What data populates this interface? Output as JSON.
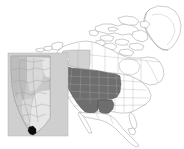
{
  "figure": {
    "kind": "distribution-range-map",
    "title": "North America distribution map with Alberta inset",
    "width": 184,
    "height": 149,
    "background_color": "#ffffff",
    "has_text_labels": false,
    "has_legend": false,
    "has_scale_bar": false,
    "has_north_arrow": false,
    "has_graticule": false
  },
  "colors": {
    "land_fill": "#ffffff",
    "land_outline": "#8f8f8f",
    "internal_border": "#a8a8a8",
    "range_primary": "#6e6e6e",
    "range_secondary": "#d2d2d2",
    "inset_panel_background": "#cfcfcf",
    "inset_land": "#c9c9c9",
    "locality_marker": "#0d0d0d"
  },
  "main_map": {
    "name": "north-america-basemap",
    "extent_description": "North America including Greenland, Canada, United States, Mexico and Central America",
    "countries_shown": [
      "Canada",
      "United States",
      "Mexico",
      "Greenland"
    ],
    "shaded_regions": [
      {
        "name": "primary-range",
        "color": "#6e6e6e",
        "tone": "dark gray",
        "description": "Western and Great Plains United States",
        "units": [
          "California",
          "Nevada",
          "Oregon",
          "Idaho",
          "Washington",
          "Montana",
          "Wyoming",
          "Utah",
          "Colorado",
          "Arizona",
          "New Mexico",
          "North Dakota",
          "South Dakota",
          "Nebraska",
          "Kansas",
          "Oklahoma",
          "Texas"
        ],
        "unit_count": 17
      },
      {
        "name": "secondary-range",
        "color": "#d2d2d2",
        "tone": "light gray",
        "description": "Southwestern Canada",
        "units": [
          "British Columbia",
          "Alberta"
        ],
        "unit_count": 2
      }
    ],
    "unshaded_description": "All remaining land is unfilled white with thin gray outlines"
  },
  "inset_map": {
    "name": "alberta-inset",
    "title": "Alberta detail inset",
    "position": "lower-left",
    "panel_color": "#cfcfcf",
    "region": "Alberta",
    "relief_description": "Grayscale shaded-relief fill with lighter plains in the southeast and darker foothills along the western edge",
    "bounds_px": {
      "x": 8,
      "y": 53,
      "width": 60,
      "height": 83
    },
    "markers": [
      {
        "name": "locality-point",
        "color": "#0d0d0d",
        "shape": "filled blob",
        "description": "Single dark locality point at the southern tip of the inset region",
        "position_px": {
          "x": 32,
          "y": 131
        }
      }
    ],
    "marker_count": 1
  }
}
